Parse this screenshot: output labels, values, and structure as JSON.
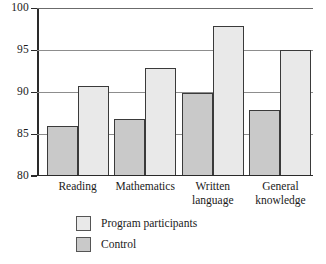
{
  "chart_data": {
    "type": "bar",
    "title": "",
    "subtitle": "",
    "xlabel": "",
    "ylabel": "",
    "ylim": [
      80,
      100
    ],
    "yticks": [
      80,
      85,
      90,
      95,
      100
    ],
    "ytick_labels": [
      "80",
      "85",
      "90",
      "95",
      "100"
    ],
    "grid": "horizontal",
    "legend_position": "below-center",
    "categories": [
      "Reading",
      "Mathematics",
      "Written language",
      "General knowledge"
    ],
    "category_labels_wrapped": [
      "Reading",
      "Mathematics",
      "Written\nlanguage",
      "General\nknowledge"
    ],
    "series": [
      {
        "name": "Program participants",
        "color": "#e9e9e9",
        "edge_color": "#3a3a3a",
        "values": [
          90.7,
          92.8,
          97.8,
          95.0
        ]
      },
      {
        "name": "Control",
        "color": "#c9c9c9",
        "edge_color": "#3a3a3a",
        "values": [
          86.0,
          86.8,
          89.9,
          87.9
        ]
      }
    ],
    "bar_draw_order_per_group": [
      "Control",
      "Program participants"
    ]
  },
  "legend": {
    "items": [
      {
        "label": "Program participants",
        "swatch_color": "#e9e9e9"
      },
      {
        "label": "Control",
        "swatch_color": "#c9c9c9"
      }
    ]
  },
  "axis": {
    "y_ticks": [
      {
        "label": "100",
        "value": 100
      },
      {
        "label": "95",
        "value": 95
      },
      {
        "label": "90",
        "value": 90
      },
      {
        "label": "85",
        "value": 85
      },
      {
        "label": "80",
        "value": 80
      }
    ]
  }
}
